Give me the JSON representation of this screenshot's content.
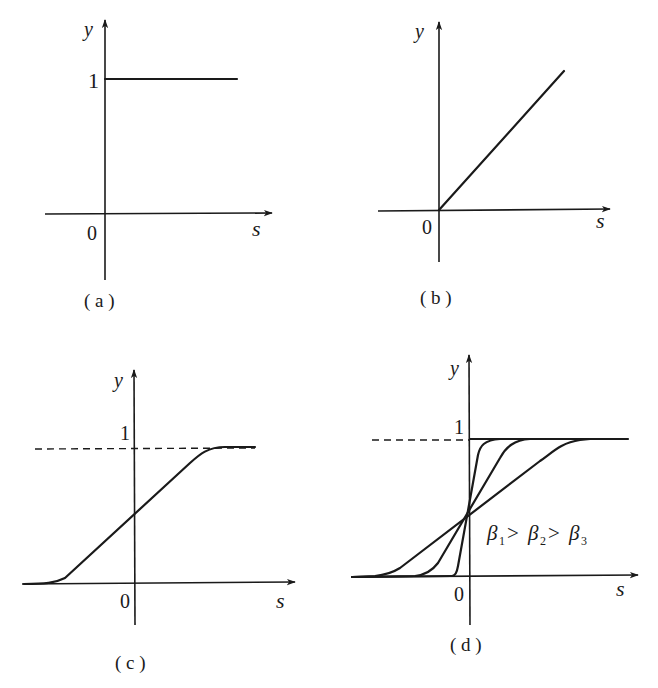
{
  "figure": {
    "panels": [
      {
        "id": "a",
        "caption": "( a )",
        "x_label": "s",
        "y_label": "y",
        "origin_label": "0",
        "y_tick_label": "1",
        "function": "constant y = 1 for s >= 0"
      },
      {
        "id": "b",
        "caption": "( b )",
        "x_label": "s",
        "y_label": "y",
        "origin_label": "0",
        "function": "linear y = s for s >= 0"
      },
      {
        "id": "c",
        "caption": "( c )",
        "x_label": "s",
        "y_label": "y",
        "origin_label": "0",
        "y_tick_label": "1",
        "asymptote": "dashed line y = 1",
        "function": "sigmoid saturating to 1"
      },
      {
        "id": "d",
        "caption": "( d )",
        "x_label": "s",
        "y_label": "y",
        "origin_label": "0",
        "y_tick_label": "1",
        "asymptote": "dashed line y = 1",
        "function": "three sigmoids with differing steepness",
        "annotation": {
          "beta": "β",
          "sub1": "1",
          "sub2": "2",
          "sub3": "3",
          "gt": ">"
        },
        "curves": [
          "β1 (steepest)",
          "β2",
          "β3 (shallowest)"
        ]
      }
    ]
  },
  "colors": {
    "ink": "#1a1a1a",
    "background": "#ffffff"
  }
}
